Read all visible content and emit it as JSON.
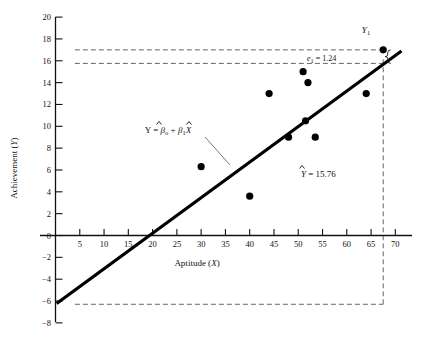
{
  "figure": {
    "background": "#ffffff",
    "ink": "#111111",
    "width": 429,
    "height": 342
  },
  "axes": {
    "x": {
      "title": "Aptitude (X)",
      "title_var": "X",
      "title_lead": "Aptitude (",
      "title_tail": ")",
      "ticks": [
        5,
        10,
        15,
        20,
        25,
        30,
        35,
        40,
        45,
        50,
        55,
        60,
        65,
        70
      ],
      "min": 0,
      "max": 72
    },
    "y": {
      "title": "Achievement (Y)",
      "title_lead": "Achievement (",
      "title_var": "Y",
      "title_tail": ")",
      "ticks": [
        -8,
        -6,
        -4,
        -2,
        0,
        2,
        4,
        6,
        8,
        10,
        12,
        14,
        16,
        18,
        20
      ],
      "min": -8,
      "max": 20
    }
  },
  "annotations": {
    "equation": {
      "lead": "Y = ",
      "beta0": "β",
      "beta0_sub": "o",
      "plus": " + ",
      "beta1": "β",
      "beta1_sub": "1",
      "xvar": "X",
      "full_text": "Y = β̂o + β̂1X"
    },
    "residual": {
      "symbol": "e",
      "subscript": "1",
      "equals": " = ",
      "value": "1.24",
      "full_text": "e1 = 1.24"
    },
    "predicted": {
      "symbol": "Y",
      "equals": " = ",
      "value": "15.76",
      "full_text": "Ŷ = 15.76"
    },
    "observed_point": {
      "symbol": "Y",
      "subscript": "1",
      "full_text": "Y1"
    }
  },
  "chart_data": {
    "type": "scatter",
    "title": "",
    "xlabel": "Aptitude (X)",
    "ylabel": "Achievement (Y)",
    "xlim": [
      0,
      72
    ],
    "ylim": [
      -8,
      20
    ],
    "grid": false,
    "legend": null,
    "x": [
      30,
      40,
      44,
      48,
      51,
      51.5,
      52,
      53.5,
      64,
      67.5
    ],
    "y": [
      6.3,
      3.6,
      13.0,
      9.0,
      15.0,
      10.5,
      14.0,
      9.0,
      13.0,
      17.0
    ],
    "points": [
      {
        "x": 30,
        "y": 6.3,
        "label": ""
      },
      {
        "x": 40,
        "y": 3.6,
        "label": ""
      },
      {
        "x": 44,
        "y": 13.0,
        "label": ""
      },
      {
        "x": 48,
        "y": 9.0,
        "label": ""
      },
      {
        "x": 51,
        "y": 15.0,
        "label": ""
      },
      {
        "x": 51.5,
        "y": 10.5,
        "label": ""
      },
      {
        "x": 52,
        "y": 14.0,
        "label": ""
      },
      {
        "x": 53.5,
        "y": 9.0,
        "label": ""
      },
      {
        "x": 64,
        "y": 13.0,
        "label": ""
      },
      {
        "x": 67.5,
        "y": 17.0,
        "label": "Y1"
      }
    ],
    "fit_line": {
      "name": "Y = β̂o + β̂1X",
      "intercept": -6.3,
      "slope": 0.3254,
      "x_start": 0.5,
      "x_end": 71,
      "x_axis_crossing": 19.4
    },
    "reference_lines": [
      {
        "name": "observed-y1-level",
        "orientation": "horizontal",
        "value": 17.0,
        "style": "dashed",
        "x_from": 4.0,
        "x_to": 67.5
      },
      {
        "name": "predicted-y-level",
        "orientation": "horizontal",
        "value": 15.76,
        "style": "dashed",
        "x_from": 4.0,
        "x_to": 67.5
      },
      {
        "name": "intercept-level",
        "orientation": "horizontal",
        "value": -6.3,
        "style": "dashed",
        "x_from": 4.0,
        "x_to": 67.5
      },
      {
        "name": "x1-vertical",
        "orientation": "vertical",
        "value": 67.5,
        "style": "dashed",
        "y_from": -6.3,
        "y_to": 16.3
      }
    ],
    "residual_marker": {
      "x": 67.5,
      "y_observed": 17.0,
      "y_predicted": 15.76,
      "residual": 1.24
    }
  }
}
